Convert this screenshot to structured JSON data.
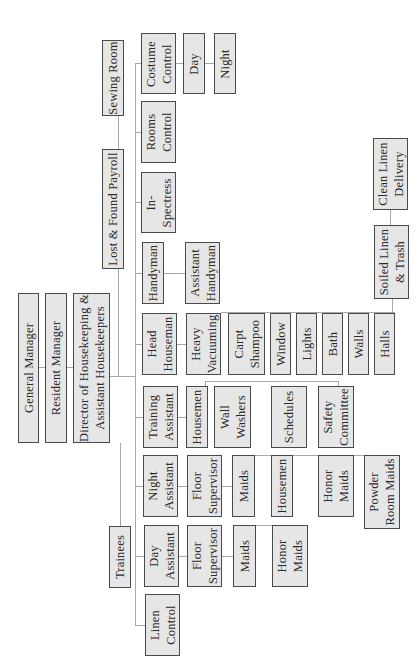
{
  "chart": {
    "orientation": "rotated-90-ccw",
    "colors": {
      "box_fill": "#e6e6e6",
      "box_border": "#4a4a4a",
      "connector": "#a8a8a8",
      "background": "#ffffff"
    }
  },
  "boxes": [
    {
      "id": "general-manager",
      "label": "General Manager",
      "x": 18,
      "y": 293,
      "w": 21,
      "h": 150
    },
    {
      "id": "resident-manager",
      "label": "Resident Manager",
      "x": 45,
      "y": 293,
      "w": 22,
      "h": 150
    },
    {
      "id": "director",
      "label": "Director of Housekeeping &\nAssistant Housekeepers",
      "x": 73,
      "y": 293,
      "w": 37,
      "h": 150
    },
    {
      "id": "sewing-room",
      "label": "Sewing Room",
      "x": 102,
      "y": 40,
      "w": 22,
      "h": 76
    },
    {
      "id": "lost-found",
      "label": "Lost & Found Payroll",
      "x": 102,
      "y": 149,
      "w": 22,
      "h": 120
    },
    {
      "id": "trainees",
      "label": "Trainees",
      "x": 109,
      "y": 526,
      "w": 22,
      "h": 62
    },
    {
      "id": "costume-control",
      "label": "Costume\nControl",
      "x": 141,
      "y": 33,
      "w": 35,
      "h": 61
    },
    {
      "id": "rooms-control",
      "label": "Rooms\nControl",
      "x": 141,
      "y": 101,
      "w": 35,
      "h": 62
    },
    {
      "id": "in-spectress",
      "label": "In-\nSpectress",
      "x": 141,
      "y": 172,
      "w": 35,
      "h": 61
    },
    {
      "id": "handyman",
      "label": "Handyman",
      "x": 142,
      "y": 242,
      "w": 22,
      "h": 62
    },
    {
      "id": "head-houseman",
      "label": "Head\nHouseman",
      "x": 142,
      "y": 313,
      "w": 35,
      "h": 62
    },
    {
      "id": "training-assistant",
      "label": "Training\nAssistant",
      "x": 143,
      "y": 386,
      "w": 35,
      "h": 62
    },
    {
      "id": "night-assistant",
      "label": "Night\nAssistant",
      "x": 143,
      "y": 455,
      "w": 35,
      "h": 62
    },
    {
      "id": "day-assistant",
      "label": "Day\nAssistant",
      "x": 144,
      "y": 525,
      "w": 35,
      "h": 62
    },
    {
      "id": "linen-control",
      "label": "Linen\nControl",
      "x": 145,
      "y": 594,
      "w": 35,
      "h": 62
    },
    {
      "id": "costume-day",
      "label": "Day",
      "x": 183,
      "y": 33,
      "w": 22,
      "h": 61
    },
    {
      "id": "costume-night",
      "label": "Night",
      "x": 214,
      "y": 33,
      "w": 22,
      "h": 61
    },
    {
      "id": "assistant-handyman",
      "label": "Assistant\nHandyman",
      "x": 185,
      "y": 242,
      "w": 35,
      "h": 62
    },
    {
      "id": "heavy-vacuuming",
      "label": "Heavy\nVacuuming",
      "x": 186,
      "y": 313,
      "w": 35,
      "h": 62
    },
    {
      "id": "housemen-training",
      "label": "Housemen",
      "x": 186,
      "y": 386,
      "w": 22,
      "h": 62
    },
    {
      "id": "floor-sup-night",
      "label": "Floor\nSupervisor",
      "x": 187,
      "y": 455,
      "w": 35,
      "h": 62
    },
    {
      "id": "floor-sup-day",
      "label": "Floor\nSupervisor",
      "x": 187,
      "y": 525,
      "w": 35,
      "h": 62
    },
    {
      "id": "carpt-shampoo",
      "label": "Carpt\nShampoo",
      "x": 228,
      "y": 313,
      "w": 37,
      "h": 62
    },
    {
      "id": "wall-washers",
      "label": "Wall\nWashers",
      "x": 214,
      "y": 386,
      "w": 37,
      "h": 62
    },
    {
      "id": "maids-night",
      "label": "Maids",
      "x": 232,
      "y": 455,
      "w": 23,
      "h": 62
    },
    {
      "id": "maids-day",
      "label": "Maids",
      "x": 233,
      "y": 525,
      "w": 23,
      "h": 62
    },
    {
      "id": "window",
      "label": "Window",
      "x": 270,
      "y": 313,
      "w": 21,
      "h": 62
    },
    {
      "id": "schedules",
      "label": "Schedules",
      "x": 271,
      "y": 386,
      "w": 36,
      "h": 62
    },
    {
      "id": "housemen-night",
      "label": "Housemen",
      "x": 271,
      "y": 455,
      "w": 22,
      "h": 62
    },
    {
      "id": "honor-maids-day",
      "label": "Honor\nMaids",
      "x": 272,
      "y": 525,
      "w": 36,
      "h": 62
    },
    {
      "id": "lights",
      "label": "Lights",
      "x": 296,
      "y": 313,
      "w": 21,
      "h": 62
    },
    {
      "id": "bath",
      "label": "Bath",
      "x": 322,
      "y": 313,
      "w": 21,
      "h": 62
    },
    {
      "id": "safety-committee",
      "label": "Safety\nCommittee",
      "x": 318,
      "y": 386,
      "w": 36,
      "h": 62
    },
    {
      "id": "honor-maids-night",
      "label": "Honor\nMaids",
      "x": 318,
      "y": 455,
      "w": 36,
      "h": 62
    },
    {
      "id": "walls",
      "label": "Walls",
      "x": 348,
      "y": 313,
      "w": 21,
      "h": 62
    },
    {
      "id": "powder-room-maids",
      "label": "Powder\nRoom Maids",
      "x": 364,
      "y": 455,
      "w": 36,
      "h": 74
    },
    {
      "id": "halls",
      "label": "Halls",
      "x": 374,
      "y": 313,
      "w": 21,
      "h": 62
    },
    {
      "id": "soiled-linen",
      "label": "Soiled Linen\n& Trash",
      "x": 374,
      "y": 225,
      "w": 35,
      "h": 74
    },
    {
      "id": "clean-linen",
      "label": "Clean Linen\nDelivery",
      "x": 373,
      "y": 138,
      "w": 35,
      "h": 72
    }
  ],
  "lines": [
    {
      "x": 39,
      "y": 367,
      "w": 6,
      "h": 1
    },
    {
      "x": 67,
      "y": 367,
      "w": 6,
      "h": 1
    },
    {
      "x": 110,
      "y": 376,
      "w": 25,
      "h": 1
    },
    {
      "x": 118,
      "y": 116,
      "w": 1,
      "h": 33
    },
    {
      "x": 118,
      "y": 269,
      "w": 1,
      "h": 107
    },
    {
      "x": 120,
      "y": 443,
      "w": 1,
      "h": 83
    },
    {
      "x": 135,
      "y": 63,
      "w": 1,
      "h": 563
    },
    {
      "x": 135,
      "y": 63,
      "w": 6,
      "h": 1
    },
    {
      "x": 135,
      "y": 132,
      "w": 6,
      "h": 1
    },
    {
      "x": 135,
      "y": 202,
      "w": 6,
      "h": 1
    },
    {
      "x": 135,
      "y": 273,
      "w": 7,
      "h": 1
    },
    {
      "x": 135,
      "y": 344,
      "w": 7,
      "h": 1
    },
    {
      "x": 135,
      "y": 417,
      "w": 8,
      "h": 1
    },
    {
      "x": 135,
      "y": 486,
      "w": 8,
      "h": 1
    },
    {
      "x": 135,
      "y": 556,
      "w": 9,
      "h": 1
    },
    {
      "x": 135,
      "y": 625,
      "w": 10,
      "h": 1
    },
    {
      "x": 176,
      "y": 63,
      "w": 38,
      "h": 1
    },
    {
      "x": 164,
      "y": 273,
      "w": 21,
      "h": 1
    },
    {
      "x": 177,
      "y": 344,
      "w": 9,
      "h": 1
    },
    {
      "x": 221,
      "y": 312,
      "w": 1,
      "h": 1
    },
    {
      "x": 178,
      "y": 417,
      "w": 8,
      "h": 1
    },
    {
      "x": 178,
      "y": 486,
      "w": 9,
      "h": 1
    },
    {
      "x": 179,
      "y": 556,
      "w": 8,
      "h": 1
    },
    {
      "x": 222,
      "y": 486,
      "w": 10,
      "h": 1
    },
    {
      "x": 222,
      "y": 556,
      "w": 11,
      "h": 1
    },
    {
      "x": 256,
      "y": 525,
      "w": 16,
      "h": 1
    },
    {
      "x": 255,
      "y": 455,
      "w": 109,
      "h": 1
    },
    {
      "x": 205,
      "y": 381,
      "w": 134,
      "h": 1
    },
    {
      "x": 338,
      "y": 381,
      "w": 1,
      "h": 5
    },
    {
      "x": 205,
      "y": 381,
      "w": 1,
      "h": 5
    },
    {
      "x": 221,
      "y": 312,
      "w": 174,
      "h": 1
    },
    {
      "x": 390,
      "y": 210,
      "w": 1,
      "h": 15
    },
    {
      "x": 392,
      "y": 299,
      "w": 1,
      "h": 14
    }
  ]
}
